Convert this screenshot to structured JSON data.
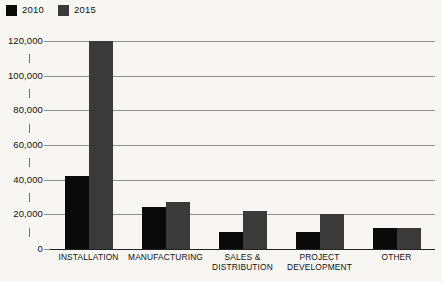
{
  "chart_data": {
    "type": "bar",
    "title": "",
    "subtitle": "",
    "xlabel": "",
    "ylabel": "",
    "ylim": [
      0,
      120000
    ],
    "ytick_step": 20000,
    "yminor_step": 10000,
    "grid": true,
    "legend_position": "top-left",
    "categories": [
      "INSTALLATION",
      "MANUFACTURING",
      "SALES &\nDISTRIBUTION",
      "PROJECT\nDEVELOPMENT",
      "OTHER"
    ],
    "ytick_labels": [
      "0",
      "20,000",
      "40,000",
      "60,000",
      "80,000",
      "100,000",
      "120,000"
    ],
    "ytick_values": [
      0,
      20000,
      40000,
      60000,
      80000,
      100000,
      120000
    ],
    "series": [
      {
        "name": "2010",
        "color": "#0a0a0a",
        "values": [
          42000,
          24000,
          10000,
          10000,
          12000
        ]
      },
      {
        "name": "2015",
        "color": "#3a3a3a",
        "values": [
          120000,
          27000,
          22000,
          20000,
          12000
        ]
      }
    ]
  },
  "legend": {
    "items": [
      {
        "label": "2010",
        "color": "#0a0a0a"
      },
      {
        "label": "2015",
        "color": "#3a3a3a"
      }
    ]
  },
  "colors": {
    "background": "#f7f6f3",
    "gridline": "#8d8d8d",
    "axis": "#222222",
    "series_2010": "#0a0a0a",
    "series_2015": "#3a3a3a"
  }
}
